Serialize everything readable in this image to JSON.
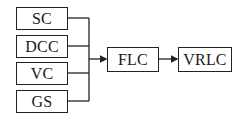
{
  "diagram": {
    "inputs": [
      {
        "label": "SC"
      },
      {
        "label": "DCC"
      },
      {
        "label": "VC"
      },
      {
        "label": "GS"
      }
    ],
    "middle": {
      "label": "FLC"
    },
    "output": {
      "label": "VRLC"
    },
    "colors": {
      "stroke": "#222222",
      "background": "#ffffff"
    }
  }
}
